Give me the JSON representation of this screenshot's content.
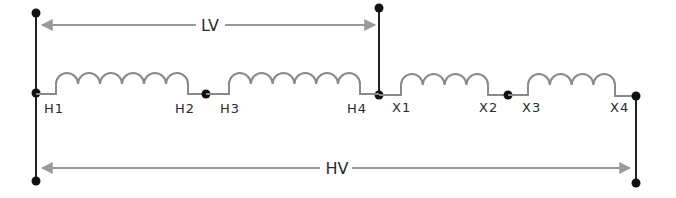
{
  "diagram": {
    "colors": {
      "wire": "#222222",
      "coil": "#8a8a8a",
      "arrow": "#9a9a9a",
      "text": "#2a2a2a",
      "background": "#ffffff"
    },
    "dimension_labels": {
      "lv": "LV",
      "hv": "HV"
    },
    "terminals": {
      "h1": "H1",
      "h2": "H2",
      "h3": "H3",
      "h4": "H4",
      "x1": "X1",
      "x2": "X2",
      "x3": "X3",
      "x4": "X4"
    },
    "coils": [
      {
        "name": "coil-h1-h2",
        "from": "H1",
        "to": "H2",
        "turns": 6
      },
      {
        "name": "coil-h3-h4",
        "from": "H3",
        "to": "H4",
        "turns": 6
      },
      {
        "name": "coil-x1-x2",
        "from": "X1",
        "to": "X2",
        "turns": 4
      },
      {
        "name": "coil-x3-x4",
        "from": "X3",
        "to": "X4",
        "turns": 4
      }
    ]
  }
}
